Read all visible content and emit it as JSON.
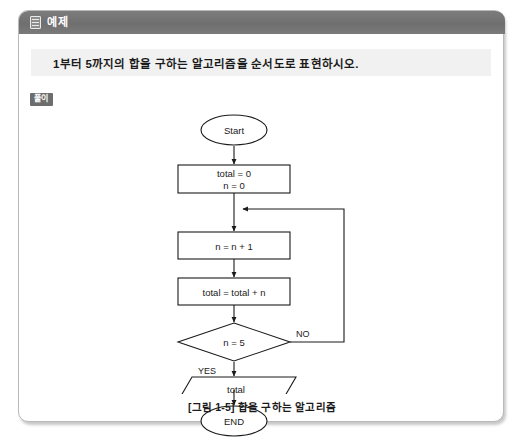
{
  "panel": {
    "header": {
      "icon": "document-icon",
      "title": "예제"
    },
    "question": "1부터 5까지의 합을 구하는 알고리즘을 순서도로 표현하시오.",
    "solution_badge": "풀이",
    "caption": "[그림 1-5] 합을 구하는 알고리즘"
  },
  "flowchart": {
    "type": "flowchart",
    "nodes": [
      {
        "id": "start",
        "shape": "terminator",
        "label": "Start"
      },
      {
        "id": "init",
        "shape": "process",
        "label_line1": "total = 0",
        "label_line2": "n = 0"
      },
      {
        "id": "incr",
        "shape": "process",
        "label": "n = n + 1"
      },
      {
        "id": "accum",
        "shape": "process",
        "label": "total = total + n"
      },
      {
        "id": "cond",
        "shape": "decision",
        "label": "n = 5"
      },
      {
        "id": "output",
        "shape": "parallelogram",
        "label": "total"
      },
      {
        "id": "end",
        "shape": "terminator",
        "label": "END"
      }
    ],
    "edges": [
      {
        "from": "start",
        "to": "init",
        "label": ""
      },
      {
        "from": "init",
        "to": "incr",
        "label": ""
      },
      {
        "from": "incr",
        "to": "accum",
        "label": ""
      },
      {
        "from": "accum",
        "to": "cond",
        "label": ""
      },
      {
        "from": "cond",
        "to": "incr",
        "label": "NO"
      },
      {
        "from": "cond",
        "to": "output",
        "label": "YES"
      },
      {
        "from": "output",
        "to": "end",
        "label": ""
      }
    ],
    "branch_labels": {
      "no": "NO",
      "yes": "YES"
    }
  },
  "colors": {
    "header_bar": "#6f6f6f",
    "question_band": "#f1f1f1",
    "badge": "#6d6d6d",
    "stroke": "#1a1a1a",
    "panel_border": "#b9b9b9"
  }
}
